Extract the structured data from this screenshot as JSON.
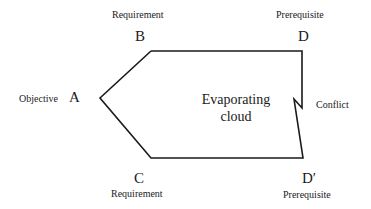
{
  "diagram": {
    "type": "evaporating-cloud",
    "center_text": [
      "Evaporating",
      "cloud"
    ],
    "nodes": {
      "A": {
        "letter": "A",
        "label": "Objective"
      },
      "B": {
        "letter": "B",
        "label": "Requirement"
      },
      "C": {
        "letter": "C",
        "label": "Requirement"
      },
      "D": {
        "letter": "D",
        "label": "Prerequisite"
      },
      "D_prime": {
        "letter": "D′",
        "label": "Prerequisite"
      }
    },
    "conflict_label": "Conflict",
    "stroke_color": "#1a1a1a"
  }
}
